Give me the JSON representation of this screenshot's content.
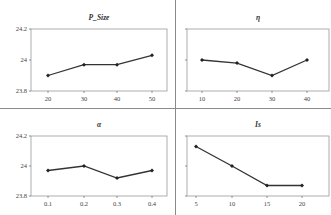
{
  "chart_data": [
    {
      "type": "line",
      "title": "P_Size",
      "categories": [
        "20",
        "30",
        "40",
        "50"
      ],
      "values": [
        23.9,
        23.97,
        23.97,
        24.03
      ],
      "ylim": [
        23.8,
        24.2
      ],
      "yticks": [
        "24.2",
        "24",
        "23.8"
      ],
      "grid": false,
      "show_yticks": true
    },
    {
      "type": "line",
      "title": "η",
      "categories": [
        "10",
        "20",
        "30",
        "40"
      ],
      "values": [
        24.0,
        23.98,
        23.9,
        24.0
      ],
      "ylim": [
        23.8,
        24.2
      ],
      "yticks": [],
      "grid": false,
      "show_yticks": false
    },
    {
      "type": "line",
      "title": "α",
      "categories": [
        "0.1",
        "0.2",
        "0.3",
        "0.4"
      ],
      "values": [
        23.97,
        24.0,
        23.92,
        23.97
      ],
      "ylim": [
        23.8,
        24.2
      ],
      "yticks": [
        "24.2",
        "24",
        "23.8"
      ],
      "grid": false,
      "show_yticks": true
    },
    {
      "type": "line",
      "title": "Is",
      "categories": [
        "5",
        "10",
        "15",
        "20"
      ],
      "values": [
        24.13,
        24.0,
        23.87,
        23.87
      ],
      "ylim": [
        23.8,
        24.2
      ],
      "yticks": [],
      "grid": false,
      "show_yticks": false
    }
  ]
}
